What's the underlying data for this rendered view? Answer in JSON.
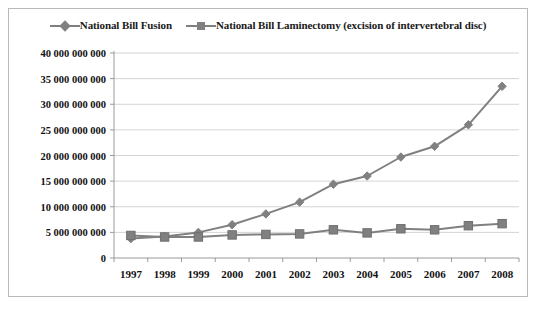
{
  "chart_data": {
    "type": "line",
    "title": "",
    "subtitle": "",
    "xlabel": "",
    "ylabel": "",
    "categories": [
      "1997",
      "1998",
      "1999",
      "2000",
      "2001",
      "2002",
      "2003",
      "2004",
      "2005",
      "2006",
      "2007",
      "2008"
    ],
    "series": [
      {
        "name": "National Bill Fusion",
        "marker": "diamond",
        "color": "#808080",
        "values": [
          3800000000,
          4200000000,
          5000000000,
          6500000000,
          8600000000,
          10900000000,
          14400000000,
          16000000000,
          19700000000,
          21800000000,
          26000000000,
          33500000000
        ]
      },
      {
        "name": "National Bill Laminectomy (excision of intervertebral disc)",
        "marker": "square",
        "color": "#808080",
        "values": [
          4400000000,
          4100000000,
          4100000000,
          4500000000,
          4600000000,
          4700000000,
          5500000000,
          4900000000,
          5700000000,
          5500000000,
          6300000000,
          6700000000
        ]
      }
    ],
    "ylim": [
      0,
      40000000000
    ],
    "ytick_values": [
      0,
      5000000000,
      10000000000,
      15000000000,
      20000000000,
      25000000000,
      30000000000,
      35000000000,
      40000000000
    ],
    "ytick_labels": [
      "0",
      "5 000 000 000",
      "10 000 000 000",
      "15 000 000 000",
      "20 000 000 000",
      "25 000 000 000",
      "30 000 000 000",
      "35 000 000 000",
      "40 000 000 000"
    ],
    "grid": true,
    "legend_position": "top"
  },
  "legend": {
    "items": [
      {
        "label": "National Bill Fusion",
        "marker": "diamond"
      },
      {
        "label": "National Bill Laminectomy (excision of intervertebral disc)",
        "marker": "square"
      }
    ]
  },
  "colors": {
    "series": "#808080",
    "grid": "#d4d4d4",
    "axis": "#9a9a9a",
    "border": "#b9b9b9",
    "text": "#111111",
    "background": "#ffffff"
  }
}
